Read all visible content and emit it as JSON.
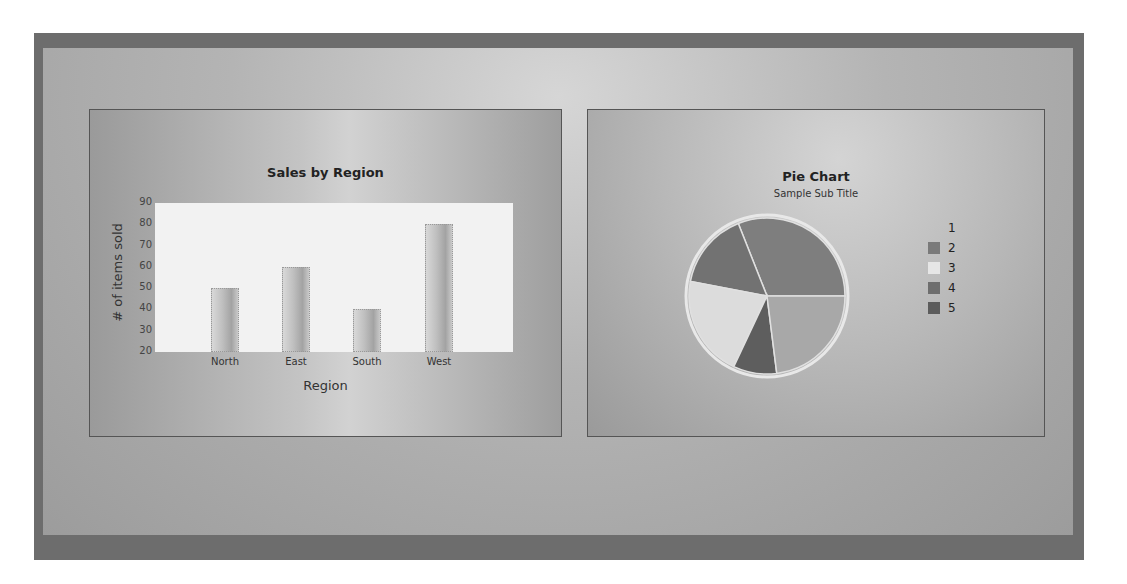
{
  "bar_chart": {
    "title": "Sales by Region",
    "xlabel": "Region",
    "ylabel": "# of items sold",
    "yticks": [
      "90",
      "80",
      "70",
      "60",
      "50",
      "40",
      "30",
      "20"
    ]
  },
  "pie_chart": {
    "title": "Pie Chart",
    "subtitle": "Sample Sub Title",
    "legend": [
      {
        "label": "1",
        "color": "#8a8a8a"
      },
      {
        "label": "2",
        "color": "#7a7a7a"
      },
      {
        "label": "3",
        "color": "#e6e6e6"
      },
      {
        "label": "4",
        "color": "#6e6e6e"
      },
      {
        "label": "5",
        "color": "#5c5c5c"
      }
    ]
  },
  "chart_data": [
    {
      "type": "bar",
      "title": "Sales by Region",
      "categories": [
        "North",
        "East",
        "South",
        "West"
      ],
      "values": [
        50,
        60,
        40,
        80
      ],
      "xlabel": "Region",
      "ylabel": "# of items sold",
      "ylim": [
        20,
        90
      ],
      "yticks": [
        20,
        30,
        40,
        50,
        60,
        70,
        80,
        90
      ],
      "grid": false,
      "legend": null
    },
    {
      "type": "pie",
      "title": "Pie Chart",
      "subtitle": "Sample Sub Title",
      "categories": [
        "1",
        "2",
        "3",
        "4",
        "5"
      ],
      "values": [
        31,
        16,
        21,
        9,
        23
      ],
      "legend_position": "right"
    }
  ]
}
